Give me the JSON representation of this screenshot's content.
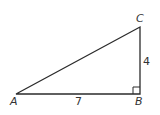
{
  "diagram": {
    "type": "right-triangle",
    "vertices": [
      {
        "name": "A",
        "label": "A",
        "x": 16,
        "y": 94
      },
      {
        "name": "B",
        "label": "B",
        "x": 140,
        "y": 94
      },
      {
        "name": "C",
        "label": "C",
        "x": 140,
        "y": 27
      }
    ],
    "sides": [
      {
        "from": "A",
        "to": "B",
        "label": "7"
      },
      {
        "from": "B",
        "to": "C",
        "label": "4"
      },
      {
        "from": "A",
        "to": "C",
        "label": ""
      }
    ],
    "right_angle_at": "B",
    "colors": {
      "stroke": "#2b2b2b",
      "text": "#333333"
    }
  }
}
